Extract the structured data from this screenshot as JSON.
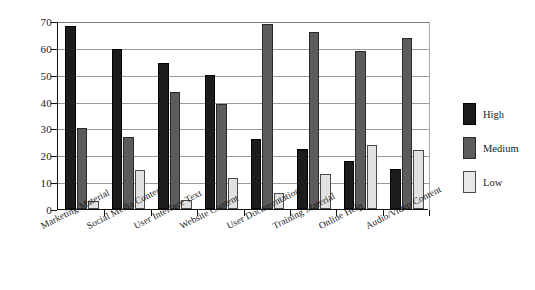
{
  "chart_data": {
    "type": "bar",
    "title": "",
    "subtitle": "",
    "xlabel": "",
    "ylabel": "",
    "ylim": [
      0,
      70
    ],
    "yticks": [
      0,
      10,
      20,
      30,
      40,
      50,
      60,
      70
    ],
    "grid": true,
    "legend_position": "right",
    "categories": [
      "Marketing Material",
      "Social Media Content",
      "User Interface Text",
      "Website Content",
      "User Documentation",
      "Training Material",
      "Online Help",
      "Audio/Video Content"
    ],
    "series": [
      {
        "name": "High",
        "color": "#1c1c1c",
        "values": [
          68,
          59.5,
          54.5,
          50,
          26,
          22.5,
          18,
          15
        ]
      },
      {
        "name": "Medium",
        "color": "#5c5c5c",
        "values": [
          30,
          27,
          43.5,
          39,
          69,
          66,
          59,
          63.5
        ]
      },
      {
        "name": "Low",
        "color": "#e2e2e2",
        "values": [
          3,
          14.5,
          3.5,
          11.5,
          6,
          13,
          24,
          22
        ]
      }
    ]
  },
  "legend": {
    "items": [
      {
        "label": "High"
      },
      {
        "label": "Medium"
      },
      {
        "label": "Low"
      }
    ]
  }
}
